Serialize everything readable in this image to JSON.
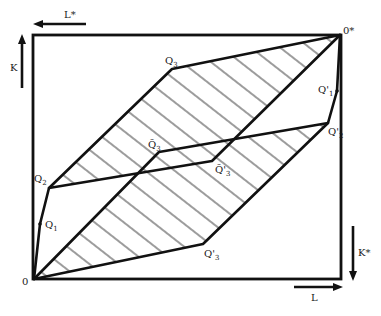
{
  "diagram": {
    "type": "Edgeworth box (factor allocation)",
    "origins": {
      "home": {
        "label": "0",
        "x": 34,
        "y": 279
      },
      "foreign": {
        "label": "0*",
        "x": 340,
        "y": 35
      }
    },
    "axes": {
      "L": {
        "label": "L",
        "direction": "right"
      },
      "K": {
        "label": "K",
        "direction": "up"
      },
      "L_star": {
        "label": "L*",
        "direction": "left"
      },
      "K_star": {
        "label": "K*",
        "direction": "down"
      }
    },
    "points": {
      "Q1": {
        "label": "Q",
        "sub": "1",
        "x": 40,
        "y": 224
      },
      "Q2": {
        "label": "Q",
        "sub": "2",
        "x": 49,
        "y": 188
      },
      "Q3": {
        "label": "Q",
        "sub": "3",
        "x": 172,
        "y": 69
      },
      "Q1p": {
        "label": "Q'",
        "sub": "1",
        "x": 337,
        "y": 91
      },
      "Q2p": {
        "label": "Q'",
        "sub": "2",
        "x": 328,
        "y": 123
      },
      "Q3p": {
        "label": "Q'",
        "sub": "3",
        "x": 203,
        "y": 244
      },
      "Q3t": {
        "label": "Q̃",
        "sub": "3",
        "x": 159,
        "y": 152
      },
      "Q3tp": {
        "label": "Q̃'",
        "sub": "3",
        "x": 212,
        "y": 161
      }
    },
    "colors": {
      "ink": "#111111",
      "background": "#ffffff"
    }
  }
}
